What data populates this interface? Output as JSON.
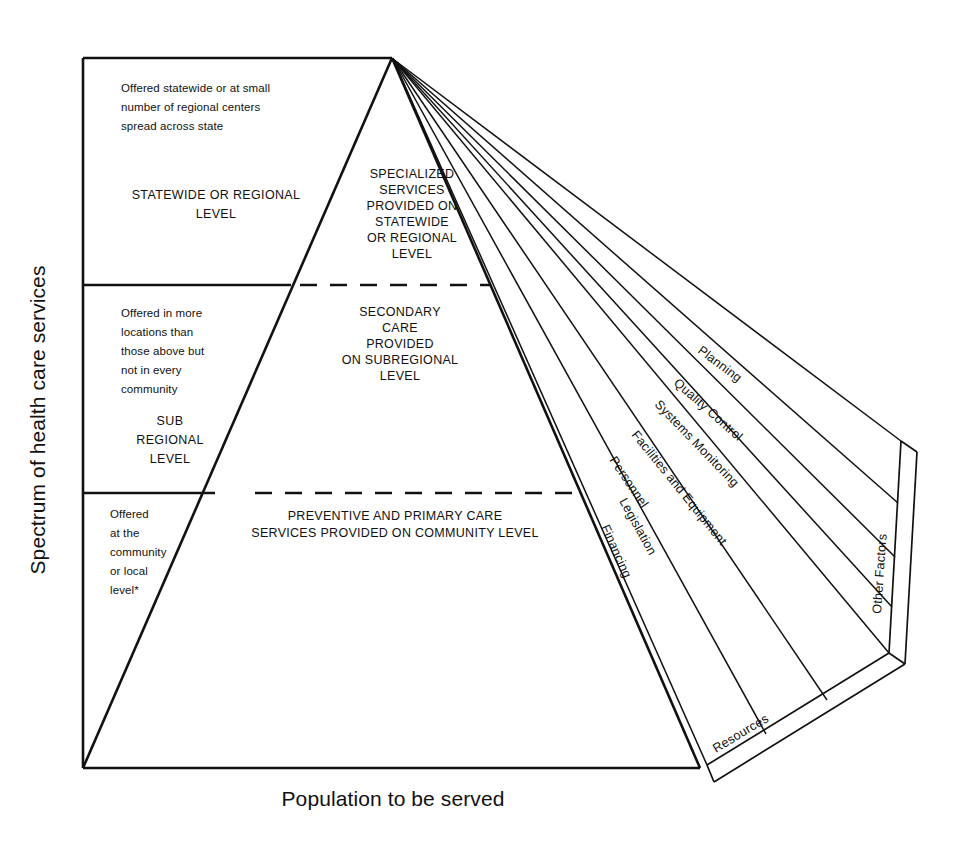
{
  "figure": {
    "type": "pyramid-fan-diagram",
    "axes": {
      "y_label": "Spectrum of health care services",
      "x_label": "Population to be served"
    },
    "tiers": [
      {
        "id": "statewide",
        "description": [
          "Offered statewide or at small",
          "number of regional centers",
          "spread across state"
        ],
        "level_label": [
          "STATEWIDE OR REGIONAL",
          "LEVEL"
        ],
        "core_label": [
          "SPECIALIZED",
          "SERVICES",
          "PROVIDED ON",
          "STATEWIDE",
          "OR REGIONAL",
          "LEVEL"
        ]
      },
      {
        "id": "subregional",
        "description": [
          "Offered in more",
          "locations than",
          "those above but",
          "not in every",
          "community"
        ],
        "level_label": [
          "SUB",
          "REGIONAL",
          "LEVEL"
        ],
        "core_label": [
          "SECONDARY",
          "CARE",
          "PROVIDED",
          "ON SUBREGIONAL",
          "LEVEL"
        ]
      },
      {
        "id": "community",
        "description": [
          "Offered",
          "at the",
          "community",
          "or local",
          "level*"
        ],
        "level_label": [],
        "core_label": [
          "PREVENTIVE AND PRIMARY CARE",
          "SERVICES PROVIDED ON COMMUNITY LEVEL"
        ]
      }
    ],
    "fan_sectors": [
      {
        "id": "planning",
        "label": "Planning"
      },
      {
        "id": "quality-control",
        "label": "Quality Control"
      },
      {
        "id": "systems-monitoring",
        "label": "Systems Monitoring"
      },
      {
        "id": "facilities-and-equipment",
        "label": "Facilities and Equipment"
      },
      {
        "id": "personnel",
        "label": "Personnel"
      },
      {
        "id": "legislation",
        "label": "Legislation"
      },
      {
        "id": "financing",
        "label": "Financing"
      }
    ],
    "edge_bands": [
      {
        "id": "resources",
        "label": "Resources"
      },
      {
        "id": "other-factors",
        "label": "Other Factors"
      }
    ],
    "colors": {
      "ink": "#111111",
      "background": "#ffffff"
    }
  }
}
